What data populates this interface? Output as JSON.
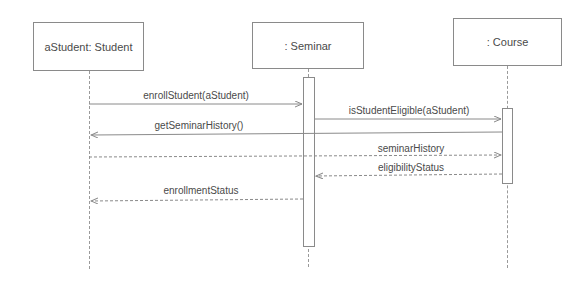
{
  "diagram": {
    "type": "UML sequence diagram",
    "participants": [
      {
        "id": "student",
        "label": "aStudent: Student"
      },
      {
        "id": "seminar",
        "label": ": Seminar"
      },
      {
        "id": "course",
        "label": ": Course"
      }
    ],
    "messages": [
      {
        "label": "enrollStudent(aStudent)",
        "from": "student",
        "to": "seminar",
        "kind": "call"
      },
      {
        "label": "isStudentEligible(aStudent)",
        "from": "seminar",
        "to": "course",
        "kind": "call"
      },
      {
        "label": "getSeminarHistory()",
        "from": "course",
        "to": "student",
        "kind": "call"
      },
      {
        "label": "seminarHistory",
        "from": "student",
        "to": "course",
        "kind": "return"
      },
      {
        "label": "eligibilityStatus",
        "from": "course",
        "to": "seminar",
        "kind": "return"
      },
      {
        "label": "enrollmentStatus",
        "from": "seminar",
        "to": "student",
        "kind": "return"
      }
    ],
    "colors": {
      "line": "#8a8a8a",
      "text": "#4a4a4a",
      "background": "#ffffff"
    }
  }
}
